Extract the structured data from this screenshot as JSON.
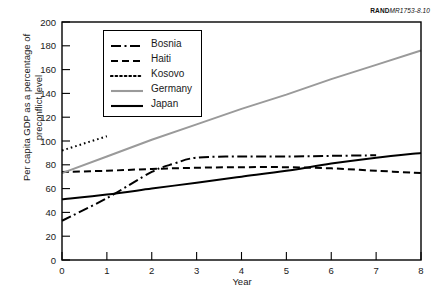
{
  "source_code": {
    "brand": "RAND",
    "document_id": "MR1753-8.10"
  },
  "chart_data": {
    "type": "line",
    "title": "",
    "xlabel": "Year",
    "ylabel": "Per capita GDP as a percentage of preconflict level",
    "ylabel_line1": "Per capita GDP as a percentage of",
    "ylabel_line2": "preconflict level",
    "xlim": [
      0,
      8
    ],
    "ylim": [
      0,
      200
    ],
    "xticks": [
      0,
      1,
      2,
      3,
      4,
      5,
      6,
      7,
      8
    ],
    "yticks": [
      0,
      20,
      40,
      60,
      80,
      100,
      120,
      140,
      160,
      180,
      200
    ],
    "xtick_labels": [
      "0",
      "1",
      "2",
      "3",
      "4",
      "5",
      "6",
      "7",
      "8"
    ],
    "ytick_labels": [
      "0",
      "20",
      "40",
      "60",
      "80",
      "100",
      "120",
      "140",
      "160",
      "180",
      "200"
    ],
    "grid": false,
    "legend_position": "upper-left-inside",
    "series": [
      {
        "name": "Bosnia",
        "style": "dash-dot",
        "color": "#000000",
        "x": [
          0,
          1,
          2,
          2.5,
          3,
          4,
          5,
          6,
          7
        ],
        "values": [
          33,
          52,
          74,
          81,
          86,
          87,
          87,
          87.5,
          88
        ]
      },
      {
        "name": "Haiti",
        "style": "dashed",
        "color": "#000000",
        "x": [
          0,
          1,
          2,
          3,
          4,
          5,
          6,
          7,
          8
        ],
        "values": [
          74,
          75,
          76.5,
          77.5,
          78,
          78,
          77,
          75,
          73
        ]
      },
      {
        "name": "Kosovo",
        "style": "dotted",
        "color": "#000000",
        "x": [
          0,
          1
        ],
        "values": [
          92,
          104
        ]
      },
      {
        "name": "Germany",
        "style": "solid",
        "color": "#9a9a9a",
        "x": [
          0,
          1,
          2,
          3,
          4,
          5,
          6,
          7,
          8
        ],
        "values": [
          73,
          87,
          101,
          114,
          127,
          139,
          152,
          164,
          176
        ]
      },
      {
        "name": "Japan",
        "style": "solid",
        "color": "#000000",
        "x": [
          0,
          1,
          2,
          3,
          4,
          5,
          6,
          7,
          8
        ],
        "values": [
          51,
          55,
          60,
          65,
          70,
          75,
          81,
          86,
          90
        ]
      }
    ]
  }
}
